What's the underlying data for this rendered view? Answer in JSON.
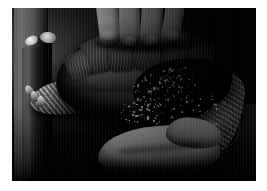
{
  "page": {
    "background_color": "#ffffff",
    "width": 267,
    "height": 191
  },
  "photo": {
    "kind": "photograph",
    "color_mode": "black-and-white",
    "border_color": "#ffffff",
    "frame": {
      "left": 12,
      "top": 8,
      "width": 244,
      "height": 173
    },
    "caption": "",
    "subject": "tortoise held in two human hands",
    "background_description": "dark studio backdrop"
  },
  "scene": {
    "elements": [
      {
        "name": "left-post",
        "label": "vertical gray post at left edge",
        "tone": "mid-gray"
      },
      {
        "name": "upper-hand",
        "label": "hand gripping carapace from above",
        "tone": "light"
      },
      {
        "name": "carapace",
        "label": "tortoise shell with growth-ring scutes",
        "tone": "dark"
      },
      {
        "name": "front-leg",
        "label": "scaly front leg with claws",
        "tone": "mid-gray"
      },
      {
        "name": "hind-leg",
        "label": "scaly hind leg",
        "tone": "mid-gray"
      },
      {
        "name": "lower-hand",
        "label": "palm supporting the tortoise",
        "tone": "light"
      },
      {
        "name": "specular-speckle",
        "label": "wet highlights on shell",
        "tone": "white"
      }
    ]
  },
  "palette": {
    "paper_white": "#ffffff",
    "highlight": "#f4f4f4",
    "skin_light": "#dcdcdc",
    "shell_mid": "#6f6f6f",
    "shadow": "#0a0a0a",
    "backdrop": "#060606"
  }
}
